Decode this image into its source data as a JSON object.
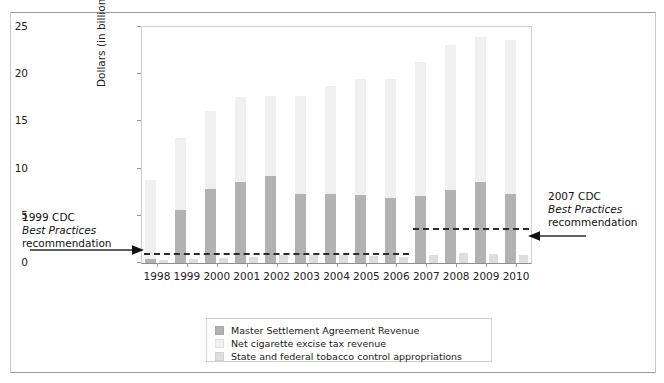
{
  "chart_data": {
    "type": "bar",
    "title": "",
    "subtitle": "",
    "xlabel": "Year",
    "ylabel": "Dollars (in billions)",
    "ylim": [
      0,
      25
    ],
    "yticks": [
      0,
      5,
      10,
      15,
      20,
      25
    ],
    "grid": false,
    "legend_position": "bottom-center",
    "stacked": true,
    "categories": [
      "1998",
      "1999",
      "2000",
      "2001",
      "2002",
      "2003",
      "2004",
      "2005",
      "2006",
      "2007",
      "2008",
      "2009",
      "2010"
    ],
    "series": [
      {
        "name": "Master Settlement Agreement Revenue",
        "color": "#b2b2b2",
        "values": [
          0.4,
          5.6,
          7.8,
          8.6,
          9.2,
          7.3,
          7.3,
          7.2,
          6.9,
          7.1,
          7.7,
          8.6,
          7.3
        ]
      },
      {
        "name": "Net cigarette excise tax revenue",
        "color": "#f0f0f0",
        "values": [
          8.4,
          7.6,
          8.3,
          9.0,
          8.5,
          10.4,
          11.4,
          12.3,
          12.6,
          14.2,
          15.4,
          15.3,
          16.3
        ]
      },
      {
        "name": "State and federal tobacco control appropriations",
        "color": "#dedede",
        "values": [
          0.3,
          0.4,
          0.5,
          0.6,
          0.8,
          0.9,
          0.8,
          0.7,
          0.6,
          0.9,
          1.1,
          1.0,
          0.8
        ]
      }
    ],
    "totals": [
      8.8,
      13.2,
      16.1,
      17.6,
      17.7,
      17.7,
      18.7,
      19.5,
      19.5,
      21.3,
      23.1,
      23.9,
      23.6
    ],
    "annotations": [
      {
        "name": "1999-cdc-best-practices",
        "line1": "1999 CDC",
        "line2": "Best Practices",
        "line3": "recommendation",
        "value": 1.1,
        "span": [
          "1998",
          "2006"
        ]
      },
      {
        "name": "2007-cdc-best-practices",
        "line1": "2007 CDC",
        "line2": "Best Practices",
        "line3": "recommendation",
        "value": 3.7,
        "span": [
          "2007",
          "2010"
        ]
      }
    ]
  },
  "legend": {
    "items": [
      {
        "label": "Master Settlement Agreement Revenue",
        "color": "#b2b2b2"
      },
      {
        "label": "Net cigarette excise tax revenue",
        "color": "#f0f0f0"
      },
      {
        "label": "State and federal tobacco control appropriations",
        "color": "#dedede"
      }
    ]
  },
  "axes": {
    "y_title": "Dollars (in billions)",
    "x_title": "Year",
    "y_tick_labels": [
      "25",
      "20",
      "15",
      "10",
      "5",
      "0"
    ],
    "x_tick_labels": [
      "1998",
      "1999",
      "2000",
      "2001",
      "2002",
      "2003",
      "2004",
      "2005",
      "2006",
      "2007",
      "2008",
      "2009",
      "2010"
    ]
  },
  "annotation_left": {
    "line1": "1999 CDC",
    "line2": "Best Practices",
    "line3": "recommendation"
  },
  "annotation_right": {
    "line1": "2007 CDC",
    "line2": "Best Practices",
    "line3": "recommendation"
  }
}
